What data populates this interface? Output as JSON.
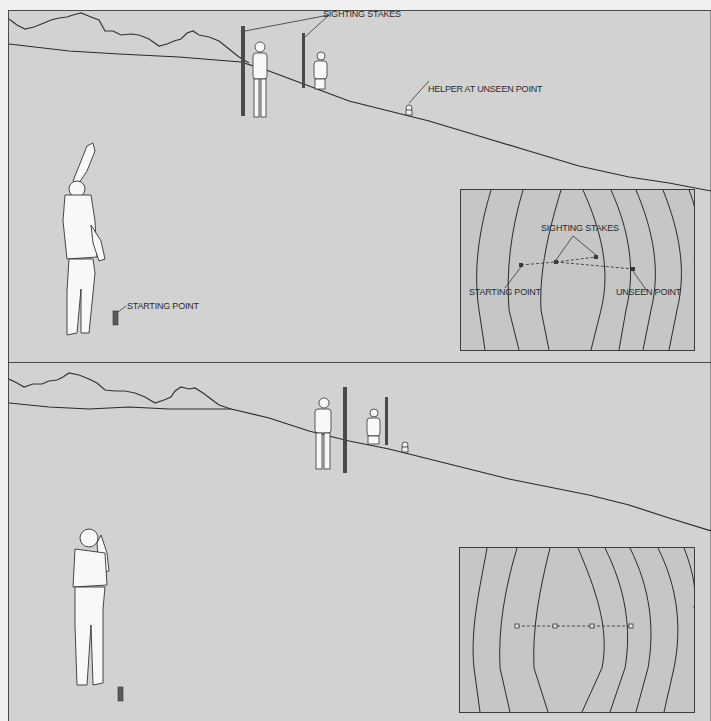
{
  "figure": {
    "panels": [
      {
        "id": "top",
        "description": "Helper moves out of sight; two sighting stakes placed in line",
        "labels": {
          "sighting_stakes": "SIGHTING STAKES",
          "helper_unseen": "HELPER AT UNSEEN POINT",
          "starting_point": "STARTING POINT"
        },
        "inset_map": {
          "labels": {
            "sighting_stakes": "SIGHTING STAKES",
            "starting_point": "STARTING POINT",
            "unseen_point": "UNSEEN POINT"
          },
          "line_style": "dashed, bent"
        }
      },
      {
        "id": "bottom",
        "description": "Stakes adjusted so all points line up straight",
        "inset_map": {
          "line_style": "dashed, straight",
          "point_count": 4
        }
      }
    ],
    "colors": {
      "background": "#d2d2d2",
      "inset": "#c6c6c6",
      "ink": "#2a2a2a"
    }
  }
}
